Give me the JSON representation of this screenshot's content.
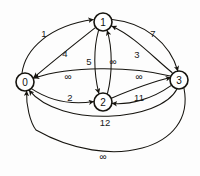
{
  "diagram": {
    "type": "directed-weighted-graph",
    "background_color": "#fdfdfd",
    "stroke_color": "#16140f",
    "nodes": [
      {
        "id": "0",
        "label": "0",
        "cx": 25,
        "cy": 82,
        "r": 9
      },
      {
        "id": "1",
        "label": "1",
        "cx": 103,
        "cy": 22,
        "r": 9
      },
      {
        "id": "2",
        "label": "2",
        "cx": 103,
        "cy": 102,
        "r": 9
      },
      {
        "id": "3",
        "label": "3",
        "cx": 179,
        "cy": 80,
        "r": 9
      }
    ],
    "edges": [
      {
        "id": "e-0-1",
        "from": "0",
        "to": "1",
        "weight": "1",
        "label_x": 44,
        "label_y": 33
      },
      {
        "id": "e-1-0",
        "from": "1",
        "to": "0",
        "weight": "4",
        "label_x": 65,
        "label_y": 53
      },
      {
        "id": "e-1-2",
        "from": "1",
        "to": "2",
        "weight": "5",
        "label_x": 89,
        "label_y": 61
      },
      {
        "id": "e-2-1",
        "from": "2",
        "to": "1",
        "weight": "∞",
        "label_x": 113,
        "label_y": 61
      },
      {
        "id": "e-1-3",
        "from": "1",
        "to": "3",
        "weight": "7",
        "label_x": 153,
        "label_y": 33
      },
      {
        "id": "e-3-1",
        "from": "3",
        "to": "1",
        "weight": "3",
        "label_x": 137,
        "label_y": 54
      },
      {
        "id": "e-3-0",
        "from": "3",
        "to": "0",
        "weight": "∞",
        "label_x": 68,
        "label_y": 76
      },
      {
        "id": "e-0-2",
        "from": "0",
        "to": "2",
        "weight": "2",
        "label_x": 70,
        "label_y": 97
      },
      {
        "id": "e-2-3",
        "from": "2",
        "to": "3",
        "weight": "∞",
        "label_x": 139,
        "label_y": 76
      },
      {
        "id": "e-3-2",
        "from": "3",
        "to": "2",
        "weight": "11",
        "label_x": 139,
        "label_y": 97
      },
      {
        "id": "e-3-0b",
        "from": "3",
        "to": "0",
        "weight": "12",
        "label_x": 105,
        "label_y": 122
      },
      {
        "id": "e-3-0c",
        "from": "3",
        "to": "0",
        "weight": "∞",
        "label_x": 103,
        "label_y": 156
      }
    ]
  }
}
